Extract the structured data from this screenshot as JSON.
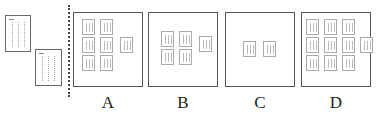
{
  "figure": {
    "source_pages": [
      {
        "name": "source-page-1",
        "columns": 3
      },
      {
        "name": "source-page-2",
        "columns": 3
      }
    ],
    "panels": [
      {
        "label": "A",
        "thumbnails": 7
      },
      {
        "label": "B",
        "thumbnails": 5
      },
      {
        "label": "C",
        "thumbnails": 2
      },
      {
        "label": "D",
        "thumbnails": 10
      }
    ]
  }
}
